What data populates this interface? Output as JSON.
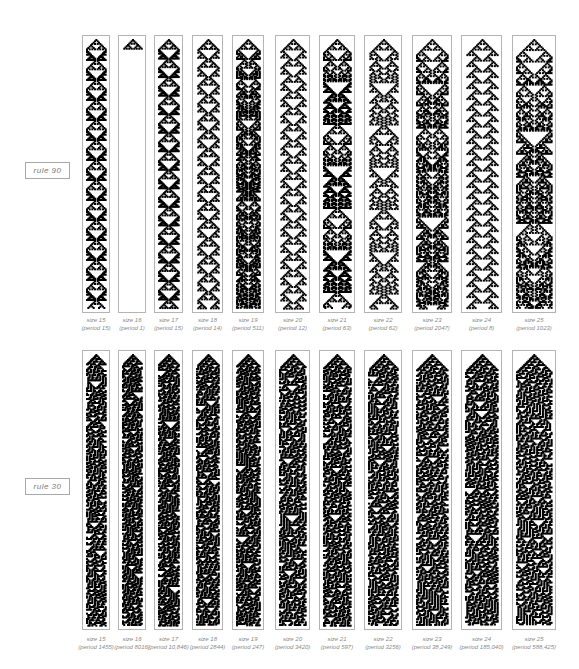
{
  "sections": [
    {
      "rule_label": "rule 90",
      "rule_number": 90,
      "panels": [
        {
          "size_label": "size 15",
          "period_label": "(period 15)",
          "size": 15
        },
        {
          "size_label": "size 16",
          "period_label": "(period 1)",
          "size": 16
        },
        {
          "size_label": "size 17",
          "period_label": "(period 15)",
          "size": 17
        },
        {
          "size_label": "size 18",
          "period_label": "(period 14)",
          "size": 18
        },
        {
          "size_label": "size 19",
          "period_label": "(period 511)",
          "size": 19
        },
        {
          "size_label": "size 20",
          "period_label": "(period 12)",
          "size": 20
        },
        {
          "size_label": "size 21",
          "period_label": "(period 63)",
          "size": 21
        },
        {
          "size_label": "size 22",
          "period_label": "(period 62)",
          "size": 22
        },
        {
          "size_label": "size 23",
          "period_label": "(period 2047)",
          "size": 23
        },
        {
          "size_label": "size 24",
          "period_label": "(period 8)",
          "size": 24
        },
        {
          "size_label": "size 25",
          "period_label": "(period 1023)",
          "size": 25
        }
      ]
    },
    {
      "rule_label": "rule 30",
      "rule_number": 30,
      "panels": [
        {
          "size_label": "size 15",
          "period_label": "(period 1455)",
          "size": 15
        },
        {
          "size_label": "size 16",
          "period_label": "(period 8016)",
          "size": 16
        },
        {
          "size_label": "size 17",
          "period_label": "(period 10,846)",
          "size": 17
        },
        {
          "size_label": "size 18",
          "period_label": "(period 2844)",
          "size": 18
        },
        {
          "size_label": "size 19",
          "period_label": "(period 247)",
          "size": 19
        },
        {
          "size_label": "size 20",
          "period_label": "(period 3420)",
          "size": 20
        },
        {
          "size_label": "size 21",
          "period_label": "(period 597)",
          "size": 21
        },
        {
          "size_label": "size 22",
          "period_label": "(period 3256)",
          "size": 22
        },
        {
          "size_label": "size 23",
          "period_label": "(period 38,249)",
          "size": 23
        },
        {
          "size_label": "size 24",
          "period_label": "(period 185,040)",
          "size": 24
        },
        {
          "size_label": "size 25",
          "period_label": "(period 588,425)",
          "size": 25
        }
      ]
    }
  ],
  "colors": {
    "cell_on": "#000000",
    "cell_off": "#ffffff",
    "border": "#b4b4b4",
    "caption": "#8a8a8a"
  }
}
